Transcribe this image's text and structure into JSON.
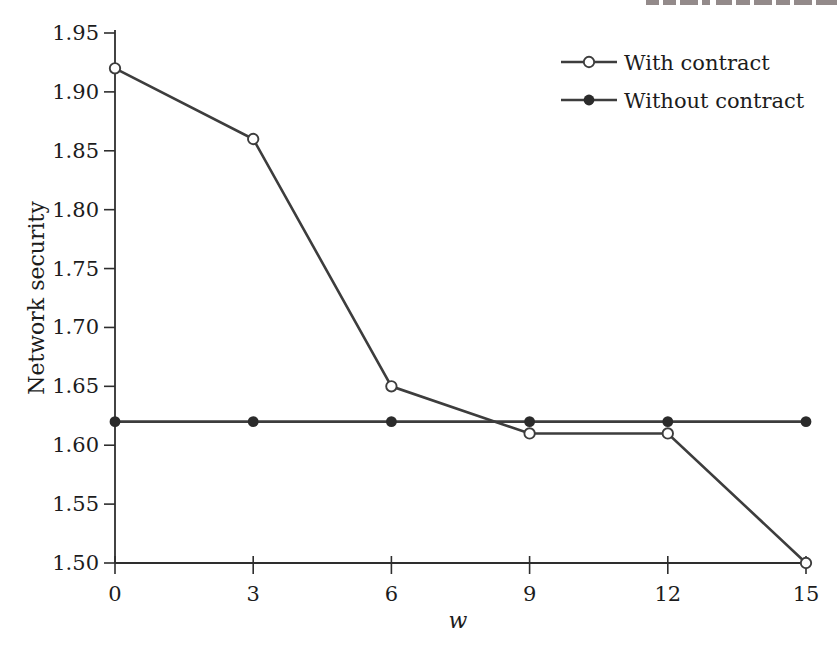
{
  "chart_data": {
    "type": "line",
    "x": [
      0,
      3,
      6,
      9,
      12,
      15
    ],
    "series": [
      {
        "name": "With contract",
        "marker": "open-circle",
        "values": [
          1.92,
          1.86,
          1.65,
          1.61,
          1.61,
          1.5
        ]
      },
      {
        "name": "Without contract",
        "marker": "filled-circle",
        "values": [
          1.62,
          1.62,
          1.62,
          1.62,
          1.62,
          1.62
        ]
      }
    ],
    "title": "",
    "xlabel": "w",
    "ylabel": "Network security",
    "xlim": [
      0,
      15
    ],
    "ylim": [
      1.5,
      1.95
    ],
    "xticks": [
      0,
      3,
      6,
      9,
      12,
      15
    ],
    "ytick_step": 0.05,
    "ytick_format_decimals": 2,
    "grid": false,
    "legend_position": "top-right",
    "colors": {
      "line": "#3d3d3d",
      "axis": "#2e2e2e",
      "text": "#1c1c1c",
      "marker_fill": "#2b2b2b",
      "marker_open_fill": "#ffffff",
      "background": "#ffffff"
    }
  }
}
